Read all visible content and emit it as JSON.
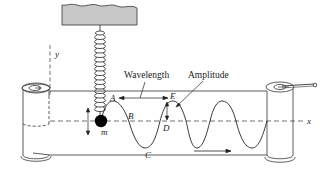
{
  "diagram": {
    "labels": {
      "wavelength": "Wavelength",
      "amplitude": "Amplitude",
      "point_a": "A",
      "point_b": "B",
      "point_c": "C",
      "point_d": "D",
      "point_e": "E",
      "mass": "m",
      "y_axis": "y",
      "x_axis": "x"
    },
    "colors": {
      "line": "#222222",
      "container_fill": "#c8c8c8",
      "mass_fill": "#000000",
      "background": "#ffffff"
    },
    "icons": {
      "spring": "spring-coil-icon",
      "mass": "mass-ball-icon",
      "left_roller": "roller-cylinder-icon",
      "right_roller": "roller-cylinder-with-crank-icon",
      "direction_arrow": "arrow-right-icon"
    }
  }
}
